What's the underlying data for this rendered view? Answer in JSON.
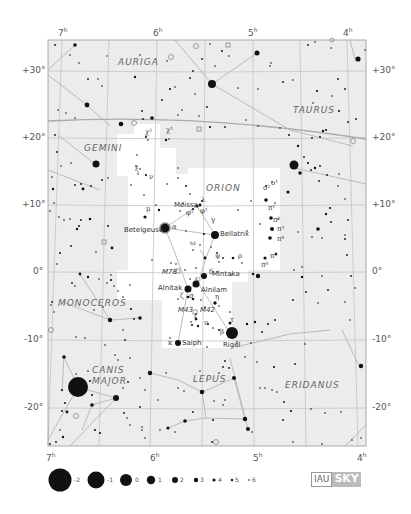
{
  "map": {
    "title": "Orion",
    "frame": {
      "left": 48,
      "top": 40,
      "right": 366,
      "bottom": 446
    },
    "colors": {
      "background": "#ececec",
      "highlight": "#ffffff",
      "grid": "#c4c4c4",
      "figure": "#b4b4b4",
      "star": "#111111"
    }
  },
  "ra_ticks_top": [
    {
      "label": "7",
      "unit": "h",
      "x": 62,
      "y": 32
    },
    {
      "label": "6",
      "unit": "h",
      "x": 156,
      "y": 32
    },
    {
      "label": "5",
      "unit": "h",
      "x": 251,
      "y": 32
    },
    {
      "label": "4",
      "unit": "h",
      "x": 345,
      "y": 32
    }
  ],
  "ra_ticks_bottom": [
    {
      "label": "7",
      "unit": "h",
      "x": 48,
      "y": 452
    },
    {
      "label": "6",
      "unit": "h",
      "x": 150,
      "y": 452
    },
    {
      "label": "5",
      "unit": "h",
      "x": 253,
      "y": 452
    },
    {
      "label": "4",
      "unit": "h",
      "x": 358,
      "y": 452
    }
  ],
  "dec_ticks_left": [
    {
      "label": "+30°",
      "y": 71
    },
    {
      "label": "+20°",
      "y": 138
    },
    {
      "label": "+10°",
      "y": 205
    },
    {
      "label": "0°",
      "y": 272
    },
    {
      "label": "-10°",
      "y": 340
    },
    {
      "label": "-20°",
      "y": 408
    }
  ],
  "dec_ticks_right": [
    {
      "label": "+30°",
      "y": 71
    },
    {
      "label": "+20°",
      "y": 138
    },
    {
      "label": "+10°",
      "y": 205
    },
    {
      "label": "0°",
      "y": 272
    },
    {
      "label": "-10°",
      "y": 340
    },
    {
      "label": "-20°",
      "y": 408
    }
  ],
  "constellations": [
    {
      "name": "AURIGA",
      "x": 118,
      "y": 57
    },
    {
      "name": "TAURUS",
      "x": 293,
      "y": 105
    },
    {
      "name": "GEMINI",
      "x": 84,
      "y": 143
    },
    {
      "name": "ORION",
      "x": 206,
      "y": 183
    },
    {
      "name": "MONOCEROS",
      "x": 58,
      "y": 298
    },
    {
      "name": "CANIS",
      "x": 92,
      "y": 365
    },
    {
      "name": "MAJOR",
      "x": 92,
      "y": 376
    },
    {
      "name": "LEPUS",
      "x": 193,
      "y": 374
    },
    {
      "name": "ERIDANUS",
      "x": 285,
      "y": 380
    }
  ],
  "named_stars": [
    {
      "name": "Betelgeuse",
      "x": 124,
      "y": 226
    },
    {
      "name": "Bellatrix",
      "x": 220,
      "y": 230
    },
    {
      "name": "Meissa",
      "x": 174,
      "y": 201
    },
    {
      "name": "Mintaka",
      "x": 212,
      "y": 274
    },
    {
      "name": "Alnitak",
      "x": 158,
      "y": 287
    },
    {
      "name": "Alnilam",
      "x": 204,
      "y": 288
    },
    {
      "name": "Saiph",
      "x": 182,
      "y": 341
    },
    {
      "name": "Rigel",
      "x": 223,
      "y": 343
    },
    {
      "name": "M78",
      "x": 162,
      "y": 272
    },
    {
      "name": "M43",
      "x": 178,
      "y": 309
    },
    {
      "name": "M42",
      "x": 200,
      "y": 309
    }
  ],
  "greek_labels": [
    {
      "t": "χ²",
      "x": 145,
      "y": 133
    },
    {
      "t": "χ¹",
      "x": 166,
      "y": 131
    },
    {
      "t": "ξ",
      "x": 135,
      "y": 170
    },
    {
      "t": "ν",
      "x": 149,
      "y": 178
    },
    {
      "t": "μ",
      "x": 146,
      "y": 210
    },
    {
      "t": "α",
      "x": 172,
      "y": 228
    },
    {
      "t": "λ",
      "x": 201,
      "y": 201
    },
    {
      "t": "φ²",
      "x": 186,
      "y": 214
    },
    {
      "t": "φ¹",
      "x": 200,
      "y": 212
    },
    {
      "t": "γ",
      "x": 211,
      "y": 221
    },
    {
      "t": "ω",
      "x": 190,
      "y": 244
    },
    {
      "t": "ψ",
      "x": 215,
      "y": 257
    },
    {
      "t": "ρ",
      "x": 238,
      "y": 257
    },
    {
      "t": "δ",
      "x": 209,
      "y": 273
    },
    {
      "t": "ε",
      "x": 195,
      "y": 280
    },
    {
      "t": "ζ",
      "x": 180,
      "y": 297
    },
    {
      "t": "σ",
      "x": 189,
      "y": 297
    },
    {
      "t": "η",
      "x": 215,
      "y": 298
    },
    {
      "t": "ι",
      "x": 194,
      "y": 318
    },
    {
      "t": "υ",
      "x": 204,
      "y": 324
    },
    {
      "t": "τ",
      "x": 230,
      "y": 321
    },
    {
      "t": "β",
      "x": 220,
      "y": 333
    },
    {
      "t": "κ",
      "x": 168,
      "y": 344
    },
    {
      "t": "ο²",
      "x": 263,
      "y": 189
    },
    {
      "t": "ο¹",
      "x": 271,
      "y": 184
    },
    {
      "t": "π¹",
      "x": 268,
      "y": 209
    },
    {
      "t": "π²",
      "x": 273,
      "y": 221
    },
    {
      "t": "π³",
      "x": 277,
      "y": 230
    },
    {
      "t": "π⁴",
      "x": 277,
      "y": 240
    },
    {
      "t": "π⁵",
      "x": 270,
      "y": 257
    },
    {
      "t": "π⁶",
      "x": 261,
      "y": 266
    }
  ],
  "legend": {
    "magnitudes": [
      {
        "label": "-2",
        "x": 60,
        "y": 480,
        "r": 11.5
      },
      {
        "label": "-1",
        "x": 96,
        "y": 480,
        "r": 8.5
      },
      {
        "label": "0",
        "x": 126,
        "y": 480,
        "r": 6
      },
      {
        "label": "1",
        "x": 151,
        "y": 480,
        "r": 4.2
      },
      {
        "label": "2",
        "x": 175,
        "y": 480,
        "r": 3
      },
      {
        "label": "3",
        "x": 196,
        "y": 480,
        "r": 2.2
      },
      {
        "label": "4",
        "x": 214,
        "y": 480,
        "r": 1.6
      },
      {
        "label": "5",
        "x": 232,
        "y": 480,
        "r": 1.2
      },
      {
        "label": "6",
        "x": 249,
        "y": 480,
        "r": 0.8
      }
    ]
  },
  "logo": {
    "left": "IAU",
    "right": "SKY"
  }
}
